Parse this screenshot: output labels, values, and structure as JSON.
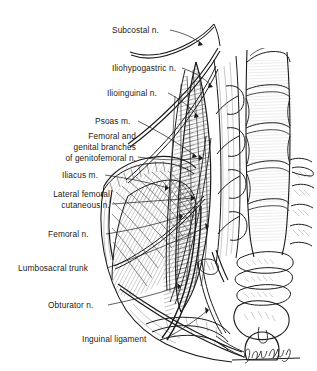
{
  "figure": {
    "background_color": "#ffffff",
    "ink_color": "#1b1b1b",
    "signature": "J. Hubeff"
  },
  "labels": [
    {
      "id": "subcostal",
      "text": "Subcostal n.",
      "x": 112,
      "y": 25,
      "align": "left"
    },
    {
      "id": "iliohypogastric",
      "text": "Iliohypogastric n.",
      "x": 112,
      "y": 63,
      "align": "left"
    },
    {
      "id": "ilioinguinal",
      "text": "Ilioinguinal n.",
      "x": 107,
      "y": 88,
      "align": "left"
    },
    {
      "id": "psoas",
      "text": "Psoas m.",
      "x": 95,
      "y": 116,
      "align": "left"
    },
    {
      "id": "genitofemoral_1",
      "text": "Femoral and",
      "x": 50,
      "y": 131,
      "align": "right"
    },
    {
      "id": "genitofemoral_2",
      "text": "genital branches",
      "x": 38,
      "y": 142,
      "align": "right"
    },
    {
      "id": "genitofemoral_3",
      "text": "of genitofemoral n.",
      "x": 22,
      "y": 153,
      "align": "right"
    },
    {
      "id": "iliacus",
      "text": "Iliacus m.",
      "x": 62,
      "y": 170,
      "align": "left"
    },
    {
      "id": "lfc_1",
      "text": "Lateral femoral",
      "x": 33,
      "y": 189,
      "align": "right"
    },
    {
      "id": "lfc_2",
      "text": "cutaneous n.",
      "x": 44,
      "y": 200,
      "align": "right"
    },
    {
      "id": "femoral",
      "text": "Femoral n.",
      "x": 48,
      "y": 229,
      "align": "left"
    },
    {
      "id": "lumbosacral",
      "text": "Lumbosacral trunk",
      "x": 18,
      "y": 263,
      "align": "left"
    },
    {
      "id": "obturator",
      "text": "Obturator n.",
      "x": 48,
      "y": 300,
      "align": "left"
    },
    {
      "id": "inguinal",
      "text": "Inguinal ligament",
      "x": 82,
      "y": 334,
      "align": "left"
    }
  ],
  "structures": [
    {
      "id": "vertebral-column",
      "name": "Lumbar vertebral bodies"
    },
    {
      "id": "psoas-muscle",
      "name": "Psoas major muscle"
    },
    {
      "id": "iliacus-muscle",
      "name": "Iliacus muscle"
    },
    {
      "id": "iliac-crest",
      "name": "Iliac crest / ala of ilium"
    },
    {
      "id": "sacrum",
      "name": "Sacrum and pubic symphysis"
    },
    {
      "id": "nerve-bundle",
      "name": "Lumbar plexus nerves"
    },
    {
      "id": "inguinal-ligament",
      "name": "Inguinal ligament"
    }
  ]
}
